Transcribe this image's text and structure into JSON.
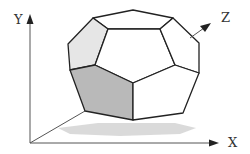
{
  "diagram": {
    "type": "3d-polyhedron-with-axes",
    "axes": {
      "x_label": "X",
      "y_label": "Y",
      "z_label": "Z"
    },
    "colors": {
      "background": "#ffffff",
      "edge": "#222222",
      "axis": "#555555",
      "face_white": "#ffffff",
      "face_light": "#e6e6e6",
      "face_dark": "#b9b9b9",
      "shadow": "#d6d6d6"
    },
    "shape": {
      "name": "polyhedron",
      "highlighted_face": "front-left pentagon (dark shaded)",
      "light_face": "upper-left face (light shaded)"
    }
  }
}
